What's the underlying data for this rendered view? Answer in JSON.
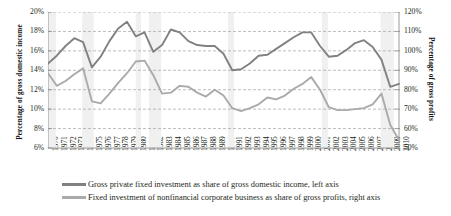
{
  "axes": {
    "y_left_title": "Percentage of gross domestic income",
    "y_right_title": "Percentage of gross profits",
    "y_left_ticks": [
      "20%",
      "18%",
      "16%",
      "14%",
      "12%",
      "10%",
      "8%",
      "6%"
    ],
    "y_right_ticks": [
      "120%",
      "110%",
      "100%",
      "90%",
      "80%",
      "70%",
      "60%",
      "50%"
    ]
  },
  "legend": {
    "items": [
      {
        "label": "Gross private fixed investment as share of gross domestic income, left axis",
        "color": "#7f8183"
      },
      {
        "label": "Fixed investment of nonfinancial corporate business as share of gross profits, right axis",
        "color": "#a8aaac"
      }
    ]
  },
  "chart_data": {
    "type": "line",
    "title": "",
    "xlabel": "",
    "ylabel": "Percentage of gross domestic income",
    "y2label": "Percentage of gross profits",
    "grid": true,
    "legend_position": "bottom",
    "ylim": [
      6,
      20
    ],
    "y2lim": [
      50,
      120
    ],
    "yticks": [
      6,
      8,
      10,
      12,
      14,
      16,
      18,
      20
    ],
    "y2ticks": [
      50,
      60,
      70,
      80,
      90,
      100,
      110,
      120
    ],
    "x": [
      1970,
      1971,
      1972,
      1973,
      1974,
      1975,
      1976,
      1977,
      1978,
      1979,
      1980,
      1981,
      1982,
      1983,
      1984,
      1985,
      1986,
      1987,
      1988,
      1989,
      1990,
      1991,
      1992,
      1993,
      1994,
      1995,
      1996,
      1997,
      1998,
      1999,
      2000,
      2001,
      2002,
      2003,
      2004,
      2005,
      2006,
      2007,
      2008,
      2009,
      2010
    ],
    "series": [
      {
        "name": "Gross private fixed investment as share of gross domestic income, left axis",
        "axis": "left",
        "color": "#7f8183",
        "values": [
          14.7,
          15.5,
          16.5,
          17.3,
          16.9,
          14.3,
          15.4,
          17.0,
          18.3,
          19.0,
          17.5,
          17.9,
          15.9,
          16.6,
          18.2,
          17.9,
          17.0,
          16.6,
          16.5,
          16.5,
          15.7,
          14.0,
          14.1,
          14.7,
          15.5,
          15.6,
          16.2,
          16.8,
          17.4,
          17.9,
          17.9,
          16.5,
          15.4,
          15.5,
          16.1,
          16.8,
          17.1,
          16.4,
          15.1,
          12.3,
          12.6
        ]
      },
      {
        "name": "Fixed investment of nonfinancial corporate business as share of gross profits, right axis",
        "axis": "right",
        "color": "#a8aaac",
        "values": [
          88.5,
          82.0,
          84.5,
          88.0,
          91.0,
          74.0,
          73.0,
          78.0,
          83.5,
          88.5,
          94.5,
          95.0,
          87.5,
          78.0,
          78.5,
          82.0,
          81.5,
          78.5,
          76.5,
          80.0,
          77.0,
          70.5,
          69.0,
          70.5,
          72.5,
          76.0,
          75.0,
          77.0,
          80.5,
          83.0,
          86.5,
          80.0,
          71.0,
          69.5,
          69.5,
          70.0,
          70.5,
          72.5,
          78.0,
          62.0,
          54.0
        ]
      }
    ],
    "recession_bands": [
      {
        "start": 1969.9,
        "end": 1970.9
      },
      {
        "start": 1973.9,
        "end": 1975.2
      },
      {
        "start": 1980.0,
        "end": 1980.6
      },
      {
        "start": 1981.5,
        "end": 1982.9
      },
      {
        "start": 1990.5,
        "end": 1991.2
      },
      {
        "start": 2001.2,
        "end": 2001.9
      },
      {
        "start": 2007.9,
        "end": 2009.4
      }
    ]
  }
}
